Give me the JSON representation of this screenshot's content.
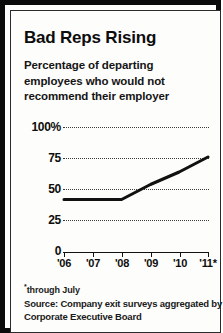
{
  "title": "Bad Reps Rising",
  "subtitle_lines": [
    "Percentage of departing",
    "employees who would not",
    "recommend their employer"
  ],
  "footnote_marker": "*",
  "footnote": "through July",
  "source_lines": [
    "Source: Company exit surveys aggregated by",
    "Corporate Executive Board"
  ],
  "colors": {
    "line": "#111111",
    "grid": "#3a3a3a",
    "axis": "#111111",
    "frame": "#0a0a0a",
    "background": "#fdfdfb",
    "text": "#0d0d0d"
  },
  "chart_data": {
    "type": "line",
    "title": "Bad Reps Rising",
    "subtitle": "Percentage of departing employees who would not recommend their employer",
    "xlabel": "",
    "ylabel": "",
    "categories": [
      "'06",
      "'07",
      "'08",
      "'09",
      "'10",
      "'11*"
    ],
    "x": [
      2006,
      2007,
      2008,
      2009,
      2010,
      2011
    ],
    "values": [
      42,
      42,
      42,
      54,
      64,
      76
    ],
    "series": [
      {
        "name": "Percentage of departing employees who would not recommend their employer",
        "values": [
          42,
          42,
          42,
          54,
          64,
          76
        ]
      }
    ],
    "ylim": [
      0,
      100
    ],
    "yticks": [
      0,
      25,
      50,
      75,
      100
    ],
    "ytick_labels": [
      "0",
      "25",
      "50",
      "75",
      "100%"
    ],
    "xtick_labels": [
      "'06",
      "'07",
      "'08",
      "'09",
      "'10",
      "'11*"
    ],
    "grid": true,
    "grid_style": "dotted-horizontal",
    "legend": false,
    "units": "percent",
    "annotations": [
      "*through July"
    ]
  }
}
